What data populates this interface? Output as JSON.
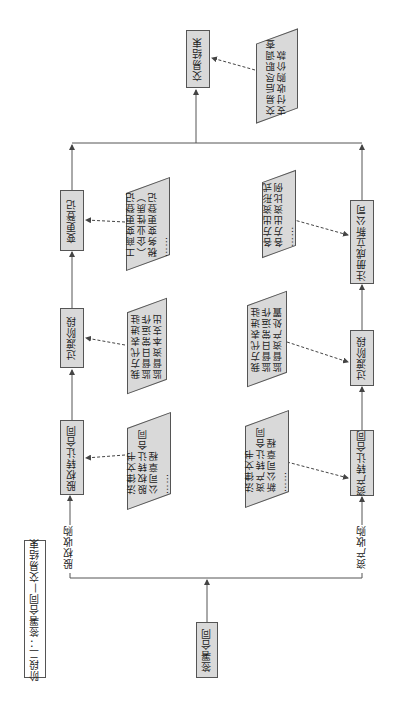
{
  "stage_title": "阶段二：签署合同—交易结束",
  "start_node": "签署合同",
  "end_node": "交易结束",
  "end_note": [
    "交易后尽职调查",
    "支付收购价款"
  ],
  "branches": {
    "equity": {
      "edge_label": "股权收购",
      "steps": [
        {
          "label": "股权转让合同",
          "note": [
            "法律文书",
            "股权转让合同",
            "公司章程",
            "……"
          ]
        },
        {
          "label": "过渡阶段",
          "note": [
            "我方代表进驻",
            "监督日常运作",
            "监督资本支出"
          ]
        },
        {
          "label": "变更登记",
          "note": [
            "工商变更登记",
            "（企业性质）",
            "税务变更登记",
            "……"
          ]
        }
      ]
    },
    "asset": {
      "edge_label": "资产收购",
      "steps": [
        {
          "label": "资产转让合同",
          "note": [
            "法律文书",
            "资产转让合同",
            "新公司章程",
            "……"
          ]
        },
        {
          "label": "过渡阶段",
          "note": [
            "我方代表进驻",
            "监督日常运作",
            "监督资产处置"
          ]
        },
        {
          "label": "注册成立新公司",
          "note": [
            "各方出资形式",
            "各方出资比例",
            "……"
          ]
        }
      ]
    }
  },
  "colors": {
    "box_fill": "#d9d9d9",
    "line": "#555555",
    "background": "#ffffff"
  }
}
